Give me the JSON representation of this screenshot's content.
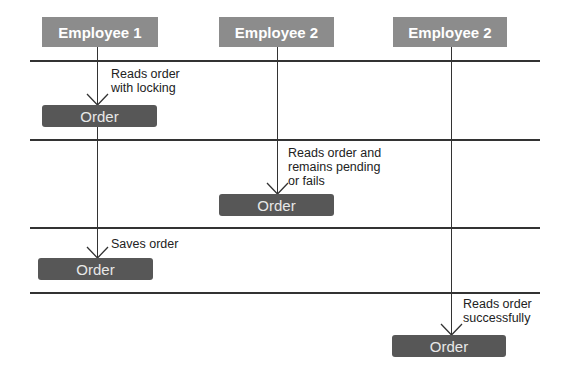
{
  "headers": [
    {
      "label": "Employee 1"
    },
    {
      "label": "Employee 2"
    },
    {
      "label": "Employee 2"
    }
  ],
  "steps": [
    {
      "label": "Reads order\nwith locking",
      "box": "Order"
    },
    {
      "label": "Reads order and\nremains pending\nor fails",
      "box": "Order"
    },
    {
      "label": "Saves order",
      "box": "Order"
    },
    {
      "label": "Reads order\nsuccessfully",
      "box": "Order"
    }
  ],
  "colors": {
    "header_bg": "#8c8c8c",
    "order_bg": "#575757",
    "line": "#333333"
  }
}
